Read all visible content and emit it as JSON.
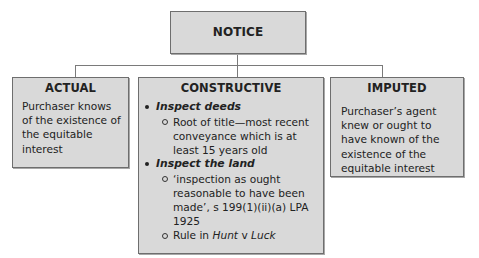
{
  "diagram": {
    "root": {
      "title": "NOTICE"
    },
    "children": [
      {
        "id": "actual",
        "title": "ACTUAL",
        "text": "Purchaser knows of the existence of the equitable interest"
      },
      {
        "id": "constructive",
        "title": "CONSTRUCTIVE",
        "items": [
          {
            "heading": "Inspect deeds",
            "subitems": [
              {
                "text": "Root of title—most recent conveyance which is at least 15 years old"
              }
            ]
          },
          {
            "heading": "Inspect the land",
            "subitems": [
              {
                "text": "‘inspection as ought reasonable to have been made’, s 199(1)(ii)(a) LPA 1925"
              },
              {
                "prefix": "Rule in ",
                "case_a": "Hunt",
                "connector": " v ",
                "case_b": "Luck"
              }
            ]
          }
        ]
      },
      {
        "id": "imputed",
        "title": "IMPUTED",
        "text": "Purchaser’s agent knew or ought to have known of the existence of the equitable interest"
      }
    ],
    "colors": {
      "box_fill": "#d9d9d9",
      "box_border": "#6e6e6e",
      "connector": "#7a7a7a",
      "text": "#222222"
    }
  }
}
